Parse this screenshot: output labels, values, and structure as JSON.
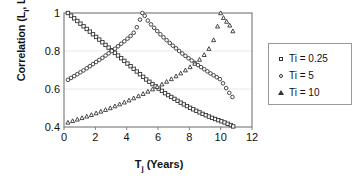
{
  "chart_data": {
    "type": "scatter",
    "title": "",
    "xlabel": "Tj (Years)",
    "xlabel_base": "T",
    "xlabel_sub": "j",
    "xlabel_rest": " (Years)",
    "ylabel": "Correlation (Li, Lj)",
    "ylabel_parts": {
      "a": "Correlation (L",
      "a_sub": "i",
      "b": ", L",
      "b_sub": "j",
      "c": ")"
    },
    "xlim": [
      0,
      12
    ],
    "ylim": [
      0.4,
      1.0
    ],
    "xticks": [
      0,
      2,
      4,
      6,
      8,
      10,
      12
    ],
    "xtick_labels": [
      "0",
      "2",
      "4",
      "6",
      "8",
      "10",
      "12"
    ],
    "yticks": [
      0.4,
      0.6,
      0.8,
      1.0
    ],
    "ytick_labels": [
      "0.4",
      "0.6",
      "0.8",
      "1"
    ],
    "grid": "horizontal",
    "grid_color": "#e8e8e8",
    "axis_color": "#808080",
    "marker_color": "#333333",
    "legend_position": "right-outside",
    "series": [
      {
        "name": "Ti = 0.25",
        "marker": "square",
        "peak_x": 0.25,
        "points": [
          [
            0.25,
            1.0
          ],
          [
            0.45,
            0.986
          ],
          [
            0.65,
            0.972
          ],
          [
            0.85,
            0.958
          ],
          [
            1.05,
            0.944
          ],
          [
            1.25,
            0.93
          ],
          [
            1.45,
            0.916
          ],
          [
            1.65,
            0.902
          ],
          [
            1.85,
            0.888
          ],
          [
            2.05,
            0.874
          ],
          [
            2.25,
            0.86
          ],
          [
            2.45,
            0.846
          ],
          [
            2.65,
            0.832
          ],
          [
            2.85,
            0.818
          ],
          [
            3.05,
            0.804
          ],
          [
            3.25,
            0.79
          ],
          [
            3.45,
            0.776
          ],
          [
            3.65,
            0.762
          ],
          [
            3.85,
            0.748
          ],
          [
            4.05,
            0.734
          ],
          [
            4.25,
            0.72
          ],
          [
            4.45,
            0.706
          ],
          [
            4.65,
            0.692
          ],
          [
            4.85,
            0.678
          ],
          [
            5.05,
            0.664
          ],
          [
            5.25,
            0.65
          ],
          [
            5.45,
            0.638
          ],
          [
            5.65,
            0.626
          ],
          [
            5.85,
            0.614
          ],
          [
            6.05,
            0.602
          ],
          [
            6.25,
            0.59
          ],
          [
            6.45,
            0.578
          ],
          [
            6.65,
            0.568
          ],
          [
            6.85,
            0.558
          ],
          [
            7.05,
            0.548
          ],
          [
            7.25,
            0.538
          ],
          [
            7.45,
            0.528
          ],
          [
            7.65,
            0.519
          ],
          [
            7.85,
            0.51
          ],
          [
            8.05,
            0.501
          ],
          [
            8.25,
            0.493
          ],
          [
            8.45,
            0.485
          ],
          [
            8.65,
            0.477
          ],
          [
            8.85,
            0.469
          ],
          [
            9.05,
            0.462
          ],
          [
            9.25,
            0.455
          ],
          [
            9.45,
            0.448
          ],
          [
            9.65,
            0.442
          ],
          [
            9.85,
            0.436
          ],
          [
            10.05,
            0.43
          ],
          [
            10.25,
            0.424
          ],
          [
            10.45,
            0.417
          ],
          [
            10.65,
            0.41
          ],
          [
            10.8,
            0.403
          ]
        ]
      },
      {
        "name": "Ti = 5",
        "marker": "circle",
        "peak_x": 5,
        "points": [
          [
            0.25,
            0.648
          ],
          [
            0.45,
            0.658
          ],
          [
            0.65,
            0.668
          ],
          [
            0.85,
            0.678
          ],
          [
            1.05,
            0.688
          ],
          [
            1.25,
            0.698
          ],
          [
            1.45,
            0.709
          ],
          [
            1.65,
            0.72
          ],
          [
            1.85,
            0.731
          ],
          [
            2.05,
            0.742
          ],
          [
            2.25,
            0.753
          ],
          [
            2.45,
            0.764
          ],
          [
            2.65,
            0.776
          ],
          [
            2.85,
            0.788
          ],
          [
            3.05,
            0.8
          ],
          [
            3.25,
            0.812
          ],
          [
            3.45,
            0.825
          ],
          [
            3.65,
            0.838
          ],
          [
            3.85,
            0.851
          ],
          [
            4.05,
            0.865
          ],
          [
            4.25,
            0.879
          ],
          [
            4.45,
            0.896
          ],
          [
            4.65,
            0.925
          ],
          [
            4.85,
            0.965
          ],
          [
            5.0,
            1.0
          ],
          [
            5.15,
            0.985
          ],
          [
            5.35,
            0.96
          ],
          [
            5.55,
            0.94
          ],
          [
            5.75,
            0.922
          ],
          [
            5.95,
            0.905
          ],
          [
            6.15,
            0.888
          ],
          [
            6.35,
            0.872
          ],
          [
            6.55,
            0.857
          ],
          [
            6.75,
            0.842
          ],
          [
            6.95,
            0.828
          ],
          [
            7.15,
            0.814
          ],
          [
            7.35,
            0.8
          ],
          [
            7.55,
            0.787
          ],
          [
            7.75,
            0.774
          ],
          [
            7.95,
            0.762
          ],
          [
            8.15,
            0.75
          ],
          [
            8.35,
            0.738
          ],
          [
            8.55,
            0.726
          ],
          [
            8.75,
            0.715
          ],
          [
            8.95,
            0.704
          ],
          [
            9.15,
            0.693
          ],
          [
            9.35,
            0.682
          ],
          [
            9.55,
            0.672
          ],
          [
            9.75,
            0.662
          ],
          [
            9.95,
            0.652
          ],
          [
            10.15,
            0.63
          ],
          [
            10.35,
            0.605
          ],
          [
            10.55,
            0.58
          ],
          [
            10.75,
            0.558
          ]
        ]
      },
      {
        "name": "Ti = 10",
        "marker": "triangle",
        "peak_x": 10,
        "points": [
          [
            0.25,
            0.424
          ],
          [
            0.55,
            0.432
          ],
          [
            0.85,
            0.44
          ],
          [
            1.15,
            0.448
          ],
          [
            1.45,
            0.456
          ],
          [
            1.75,
            0.464
          ],
          [
            2.05,
            0.473
          ],
          [
            2.35,
            0.482
          ],
          [
            2.65,
            0.491
          ],
          [
            2.95,
            0.5
          ],
          [
            3.25,
            0.51
          ],
          [
            3.55,
            0.52
          ],
          [
            3.85,
            0.53
          ],
          [
            4.15,
            0.541
          ],
          [
            4.45,
            0.552
          ],
          [
            4.75,
            0.563
          ],
          [
            5.05,
            0.575
          ],
          [
            5.35,
            0.587
          ],
          [
            5.65,
            0.599
          ],
          [
            5.95,
            0.612
          ],
          [
            6.25,
            0.625
          ],
          [
            6.55,
            0.639
          ],
          [
            6.85,
            0.653
          ],
          [
            7.15,
            0.668
          ],
          [
            7.45,
            0.683
          ],
          [
            7.75,
            0.699
          ],
          [
            8.05,
            0.716
          ],
          [
            8.35,
            0.734
          ],
          [
            8.65,
            0.755
          ],
          [
            8.95,
            0.78
          ],
          [
            9.25,
            0.812
          ],
          [
            9.55,
            0.858
          ],
          [
            9.8,
            0.93
          ],
          [
            10.0,
            1.0
          ],
          [
            10.18,
            0.975
          ],
          [
            10.38,
            0.955
          ],
          [
            10.58,
            0.935
          ],
          [
            10.78,
            0.905
          ]
        ]
      }
    ]
  }
}
